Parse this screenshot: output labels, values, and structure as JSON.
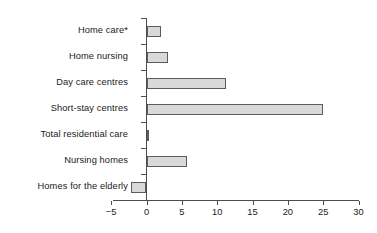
{
  "chart_data": {
    "type": "bar",
    "orientation": "horizontal",
    "title": "",
    "xlabel": "",
    "ylabel": "",
    "categories": [
      "Home care*",
      "Home nursing",
      "Day care centres",
      "Short-stay centres",
      "Total residential care",
      "Nursing homes",
      "Homes for the elderly"
    ],
    "values": [
      2.0,
      3.1,
      11.3,
      25.0,
      0.4,
      5.8,
      -2.2
    ],
    "xlim": [
      -5,
      30
    ],
    "xticks": [
      -5,
      0,
      5,
      10,
      15,
      20,
      25,
      30
    ],
    "xtick_labels": [
      "−5",
      "0",
      "5",
      "10",
      "15",
      "20",
      "25",
      "30"
    ],
    "grid": false,
    "legend": null,
    "series": [
      {
        "name": "",
        "values": [
          2.0,
          3.1,
          11.3,
          25.0,
          0.4,
          5.8,
          -2.2
        ]
      }
    ]
  },
  "style": {
    "bar_fill": "#d9d9d9",
    "bar_border": "#5c5c5c",
    "axis_color": "#4d4d4d",
    "text_color": "#1a1a1a",
    "background": "#ffffff"
  }
}
